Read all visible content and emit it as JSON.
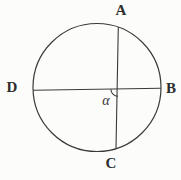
{
  "figure": {
    "type": "circle-with-intersecting-chords",
    "labels": {
      "top": "A",
      "right": "B",
      "bottom": "C",
      "left": "D",
      "angle": "α"
    }
  },
  "colors": {
    "ink": "#3a3a3a",
    "background": "#fcfcfb"
  }
}
